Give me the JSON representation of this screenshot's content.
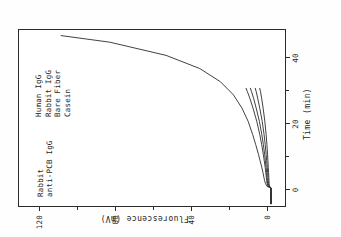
{
  "figure": {
    "rotation_note": "figure printed sideways (rotated 90 degrees counter-clockwise)",
    "annotation_main_line1": "Rabbit",
    "annotation_main_line2": "anti-PCB IgG"
  },
  "chart_data": {
    "type": "line",
    "title": "",
    "xlabel": "Time (min)",
    "ylabel": "Fluorescence (mV)",
    "xlim": [
      -6,
      48
    ],
    "ylim": [
      -8,
      135
    ],
    "xticks": [
      0,
      20,
      40
    ],
    "xticklabels": [
      "0",
      "20",
      "40"
    ],
    "yticks": [
      0,
      40,
      80,
      120
    ],
    "yticklabels": [
      "0",
      "40",
      "80",
      "120"
    ],
    "xminorticks": [
      10,
      30
    ],
    "yminorticks": [
      20,
      60,
      100
    ],
    "grid": false,
    "legend_position": "inside-upper-right (labels beside curves)",
    "annotations": [
      {
        "text": "Rabbit anti-PCB IgG",
        "x": 6,
        "y": 118,
        "series": "Rabbit anti-PCB IgG"
      }
    ],
    "series": [
      {
        "name": "Rabbit anti-PCB IgG",
        "color": "#2b2b2b",
        "x": [
          -5,
          -0.3,
          0,
          0.2,
          0.6,
          1.2,
          2,
          3,
          4.5,
          6,
          8,
          10,
          13,
          16,
          20,
          24,
          28,
          32,
          36,
          40,
          44,
          46
        ],
        "y": [
          0,
          0,
          0.5,
          2,
          2.5,
          3,
          3.4,
          3.8,
          4.3,
          4.9,
          5.8,
          6.7,
          8.2,
          9.8,
          12.2,
          15.5,
          20,
          27,
          38,
          56,
          86,
          112
        ]
      },
      {
        "name": "Human IgG",
        "color": "#2b2b2b",
        "x": [
          -5,
          -0.3,
          0,
          0.2,
          0.6,
          1.2,
          2,
          3,
          4.5,
          6,
          8,
          10,
          13,
          16,
          20,
          24,
          27,
          29,
          30
        ],
        "y": [
          0,
          0,
          0.5,
          1.6,
          1.9,
          2.1,
          2.3,
          2.5,
          2.8,
          3.1,
          3.6,
          4.1,
          5.0,
          6.0,
          7.6,
          9.6,
          11.3,
          12.6,
          13.3
        ]
      },
      {
        "name": "Rabbit IgG",
        "color": "#2b2b2b",
        "x": [
          -5,
          -0.3,
          0,
          0.2,
          0.6,
          1.2,
          2,
          3,
          4.5,
          6,
          8,
          10,
          13,
          16,
          20,
          24,
          27,
          29,
          30
        ],
        "y": [
          0,
          0,
          0.4,
          1.4,
          1.6,
          1.8,
          1.95,
          2.1,
          2.35,
          2.6,
          3.0,
          3.4,
          4.1,
          4.9,
          6.2,
          7.9,
          9.3,
          10.4,
          11.0
        ]
      },
      {
        "name": "Bare Fiber",
        "color": "#2b2b2b",
        "x": [
          -5,
          -0.3,
          0,
          0.2,
          0.6,
          1.2,
          2,
          3,
          4.5,
          6,
          8,
          10,
          13,
          16,
          20,
          24,
          27,
          29,
          30
        ],
        "y": [
          0,
          0,
          0.3,
          1.1,
          1.25,
          1.4,
          1.5,
          1.6,
          1.8,
          2.0,
          2.3,
          2.6,
          3.1,
          3.7,
          4.7,
          6.0,
          7.1,
          7.9,
          8.4
        ]
      },
      {
        "name": "Casein",
        "color": "#2b2b2b",
        "x": [
          -5,
          -0.3,
          0,
          0.2,
          0.6,
          1.2,
          2,
          3,
          4.5,
          6,
          8,
          10,
          13,
          16,
          20,
          24,
          27,
          29,
          30
        ],
        "y": [
          0,
          0,
          0.2,
          0.8,
          0.9,
          1.0,
          1.08,
          1.15,
          1.3,
          1.45,
          1.65,
          1.85,
          2.2,
          2.6,
          3.3,
          4.2,
          5.0,
          5.6,
          6.0
        ]
      }
    ]
  },
  "legend": {
    "items": [
      {
        "label": "Human IgG"
      },
      {
        "label": "Rabbit IgG"
      },
      {
        "label": "Bare Fiber"
      },
      {
        "label": "Casein"
      }
    ]
  }
}
